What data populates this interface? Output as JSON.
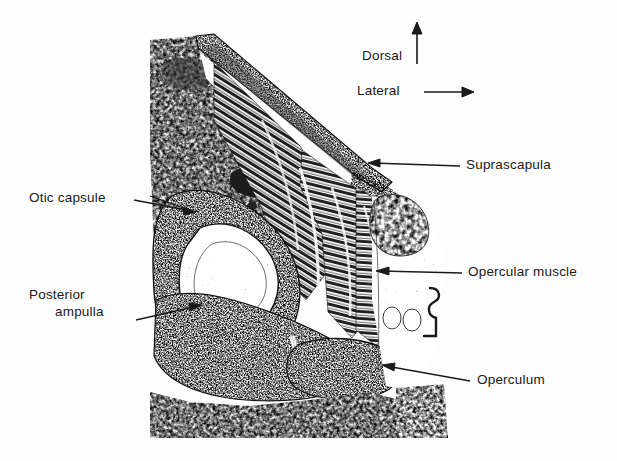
{
  "figure": {
    "background_color": "#fdfdfd",
    "ink_color": "#1a1a1a"
  },
  "orientation": {
    "dorsal": {
      "label": "Dorsal",
      "arrow": "up-arrow-icon"
    },
    "lateral": {
      "label": "Lateral",
      "arrow": "right-arrow-icon"
    }
  },
  "labels": {
    "suprascapula": "Suprascapula",
    "opercular_muscle": "Opercular  muscle",
    "operculum": "Operculum",
    "otic_capsule": "Otic capsule",
    "posterior_ampulla_line1": "Posterior",
    "posterior_ampulla_line2": "ampulla"
  },
  "structures": [
    {
      "name": "trabecular-bone",
      "description": "cancellous bone, coarse reticulate stipple",
      "tone": "mid-grey"
    },
    {
      "name": "suprascapula",
      "description": "dark diagonal cartilage band running from upper-left to lower-right",
      "tone": "dark"
    },
    {
      "name": "opercular-muscle",
      "description": "parallel longitudinal muscle fibres fanning from suprascapula to operculum",
      "tone": "striated-dark"
    },
    {
      "name": "otic-capsule",
      "description": "dense stippled capsule wall enclosing a pale labyrinth cavity",
      "tone": "dark-stipple"
    },
    {
      "name": "labyrinth-cavity",
      "description": "pale, sparsely stippled inner chamber",
      "tone": "light"
    },
    {
      "name": "posterior-ampulla",
      "description": "small dark nodule on the inferior margin of the labyrinth cavity",
      "tone": "very-dark"
    },
    {
      "name": "operculum",
      "description": "dense dark ovoid plate at the lower right of the otic capsule",
      "tone": "very-dark"
    },
    {
      "name": "connective-tissue",
      "description": "loose pale stippled tissue and vessels lateral to the capsule",
      "tone": "light"
    }
  ]
}
